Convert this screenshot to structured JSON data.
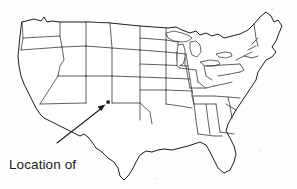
{
  "figure": {
    "kind": "outline-map",
    "region": "Contiguous United States",
    "background_color": "#fdfdfc",
    "line_color": "#2a2a2a",
    "width_px": 297,
    "height_px": 188
  },
  "caption": {
    "line_1": "Location of",
    "line_2": "map 1",
    "full_text": "Location of map 1",
    "font_size_px": 13.5,
    "color": "#1b1b1b",
    "x_px": 9,
    "y_px": 141
  },
  "marker": {
    "name": "map-1-location-marker",
    "shape": "square",
    "color": "#111111",
    "x_px": 108,
    "y_px": 102,
    "size_px": 3,
    "described_region": "northern New Mexico"
  },
  "pointer": {
    "name": "caption-pointer-arrow",
    "color": "#1c1c1c",
    "tail_x_px": 57,
    "tail_y_px": 143,
    "tip_x_px": 104,
    "tip_y_px": 106
  },
  "map_features": {
    "state_boundaries_visible": true,
    "state_labels_visible": false,
    "great_lakes_visible": true,
    "coastline_visible": true,
    "legend_visible": false,
    "scale_bar_visible": false,
    "north_arrow_visible": false
  }
}
